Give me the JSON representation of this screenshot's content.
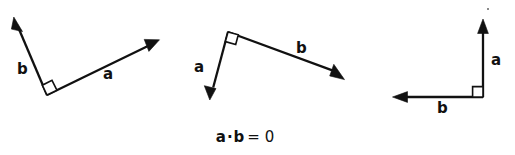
{
  "figure": {
    "background_color": "#ffffff",
    "ink_color": "#111111",
    "caption": {
      "vector_a": "a",
      "dot_operator": "·",
      "vector_b": "b",
      "equals_zero": "= 0",
      "full_text": "a · b = 0"
    },
    "panels": [
      {
        "id": "panel-1",
        "name": "acute-orientation",
        "vertex": [
          47,
          95
        ],
        "right_angle_marker": true,
        "vectors": [
          {
            "name": "b",
            "label": "b",
            "label_pos": [
              17,
              62
            ],
            "tip": [
              15,
              22
            ],
            "direction": "up-left"
          },
          {
            "name": "a",
            "label": "a",
            "label_pos": [
              103,
              67
            ],
            "tip": [
              158,
              40
            ],
            "direction": "up-right"
          }
        ]
      },
      {
        "id": "panel-2",
        "name": "apex-orientation",
        "vertex": [
          228,
          32
        ],
        "right_angle_marker": true,
        "vectors": [
          {
            "name": "a",
            "label": "a",
            "label_pos": [
              194,
              60
            ],
            "tip": [
              210,
              98
            ],
            "direction": "down-left"
          },
          {
            "name": "b",
            "label": "b",
            "label_pos": [
              296,
              41
            ],
            "tip": [
              343,
              78
            ],
            "direction": "down-right"
          }
        ]
      },
      {
        "id": "panel-3",
        "name": "axis-aligned-orientation",
        "vertex": [
          483,
          97
        ],
        "right_angle_marker": true,
        "vectors": [
          {
            "name": "a",
            "label": "a",
            "label_pos": [
              491,
              53
            ],
            "tip": [
              483,
              20
            ],
            "direction": "up"
          },
          {
            "name": "b",
            "label": "b",
            "label_pos": [
              437,
              101
            ],
            "tip": [
              393,
              97
            ],
            "direction": "left"
          }
        ]
      }
    ]
  }
}
